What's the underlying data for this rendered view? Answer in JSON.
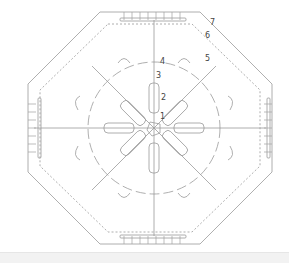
{
  "diagram": {
    "type": "crochet-chart-octagon",
    "stroke_color": "#9a9a9a",
    "center": [
      154,
      128
    ],
    "round_labels": [
      {
        "text": "1",
        "x": 160,
        "y": 113
      },
      {
        "text": "2",
        "x": 161,
        "y": 94
      },
      {
        "text": "3",
        "x": 156,
        "y": 72
      },
      {
        "text": "4",
        "x": 160,
        "y": 58
      },
      {
        "text": "5",
        "x": 205,
        "y": 55
      },
      {
        "text": "6",
        "x": 205,
        "y": 32
      },
      {
        "text": "7",
        "x": 210,
        "y": 19
      }
    ]
  }
}
